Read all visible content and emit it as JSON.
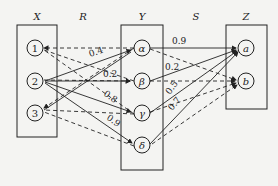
{
  "sets": {
    "X": {
      "label": "X",
      "nodes": [
        "1",
        "2",
        "3"
      ]
    },
    "Y": {
      "label": "Y",
      "nodes": [
        "α",
        "β",
        "γ",
        "δ"
      ]
    },
    "Z": {
      "label": "Z",
      "nodes": [
        "a",
        "b"
      ]
    }
  },
  "relations": {
    "R": {
      "label": "R"
    },
    "S": {
      "label": "S"
    }
  },
  "weights": {
    "r_2_alpha": "0.4",
    "r_2_beta": "0.2",
    "r_2_gamma": "0.8",
    "r_2_delta": "0.9",
    "s_alpha_a": "0.9",
    "s_beta_a": "0.2",
    "s_gamma_a": "0.5",
    "s_delta_a": "0.7"
  },
  "colors": {
    "line": "#222222",
    "background": "#f4f4f2"
  }
}
